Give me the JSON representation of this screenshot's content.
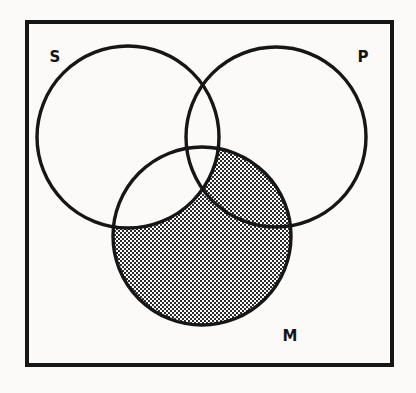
{
  "figure": {
    "kind": "venn-diagram",
    "background_color": "#fbfaf8",
    "ink_color": "#141414",
    "shade_color": "#9a9a9a",
    "shade_pattern": "halftone-dots"
  },
  "frame": {
    "name": "universe-box",
    "x": 27,
    "y": 22,
    "width": 365,
    "height": 343,
    "stroke_width": 4,
    "color": "#141414"
  },
  "circles": [
    {
      "id": "S",
      "label": "S",
      "cx": 128,
      "cy": 137,
      "r": 91,
      "stroke_width": 3.4,
      "fill": "none"
    },
    {
      "id": "P",
      "label": "P",
      "cx": 276,
      "cy": 137,
      "r": 90,
      "stroke_width": 3.4,
      "fill": "none"
    },
    {
      "id": "M",
      "label": "M",
      "cx": 202,
      "cy": 236,
      "r": 89,
      "stroke_width": 3.4,
      "fill": "none"
    }
  ],
  "labels": [
    {
      "id": "label-S",
      "text": "S",
      "x": 55,
      "y": 62
    },
    {
      "id": "label-P",
      "text": "P",
      "x": 363,
      "y": 62
    },
    {
      "id": "label-M",
      "text": "M",
      "x": 290,
      "y": 341
    }
  ],
  "shading": {
    "description": "The portion of circle M lying outside circle S is shaded; the lune S-and-M and the central S-and-P-and-M region remain unshaded.",
    "shaded_regions": [
      "M only",
      "M and P only"
    ],
    "unshaded_regions": [
      "S only",
      "P only",
      "S and P only",
      "S and M only",
      "S and P and M"
    ],
    "shaded_set_expression": "M − S",
    "fill_style": "fine dotted halftone"
  }
}
